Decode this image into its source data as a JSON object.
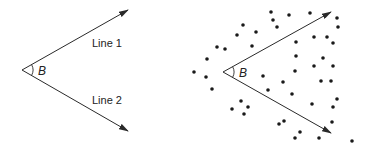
{
  "left_panel": {
    "angle_label": "B",
    "line1_label": "Line 1",
    "line2_label": "Line 2",
    "vertex": [
      22,
      70
    ],
    "line1_end": [
      128,
      10
    ],
    "line2_end": [
      128,
      131
    ]
  },
  "right_panel": {
    "angle_label": "B",
    "vertex": [
      223,
      72
    ],
    "line1_end": [
      331,
      12
    ],
    "line2_end": [
      331,
      133
    ],
    "dots": [
      [
        271,
        12
      ],
      [
        289,
        15
      ],
      [
        310,
        13
      ],
      [
        337,
        18
      ],
      [
        273,
        20
      ],
      [
        277,
        27
      ],
      [
        338,
        27
      ],
      [
        243,
        25
      ],
      [
        256,
        32
      ],
      [
        237,
        35
      ],
      [
        217,
        47
      ],
      [
        225,
        49
      ],
      [
        252,
        46
      ],
      [
        296,
        42
      ],
      [
        314,
        37
      ],
      [
        327,
        37
      ],
      [
        333,
        43
      ],
      [
        207,
        59
      ],
      [
        296,
        56
      ],
      [
        323,
        58
      ],
      [
        314,
        66
      ],
      [
        333,
        66
      ],
      [
        295,
        71
      ],
      [
        194,
        72
      ],
      [
        206,
        77
      ],
      [
        263,
        76
      ],
      [
        283,
        82
      ],
      [
        321,
        81
      ],
      [
        331,
        81
      ],
      [
        212,
        89
      ],
      [
        268,
        90
      ],
      [
        292,
        94
      ],
      [
        337,
        99
      ],
      [
        241,
        101
      ],
      [
        248,
        107
      ],
      [
        232,
        109
      ],
      [
        244,
        114
      ],
      [
        312,
        104
      ],
      [
        333,
        107
      ],
      [
        332,
        122
      ],
      [
        284,
        121
      ],
      [
        279,
        124
      ],
      [
        300,
        132
      ],
      [
        295,
        138
      ],
      [
        319,
        138
      ],
      [
        352,
        141
      ]
    ]
  },
  "colors": {
    "stroke": "#2a2a2a",
    "dot": "#1a1a1a"
  }
}
